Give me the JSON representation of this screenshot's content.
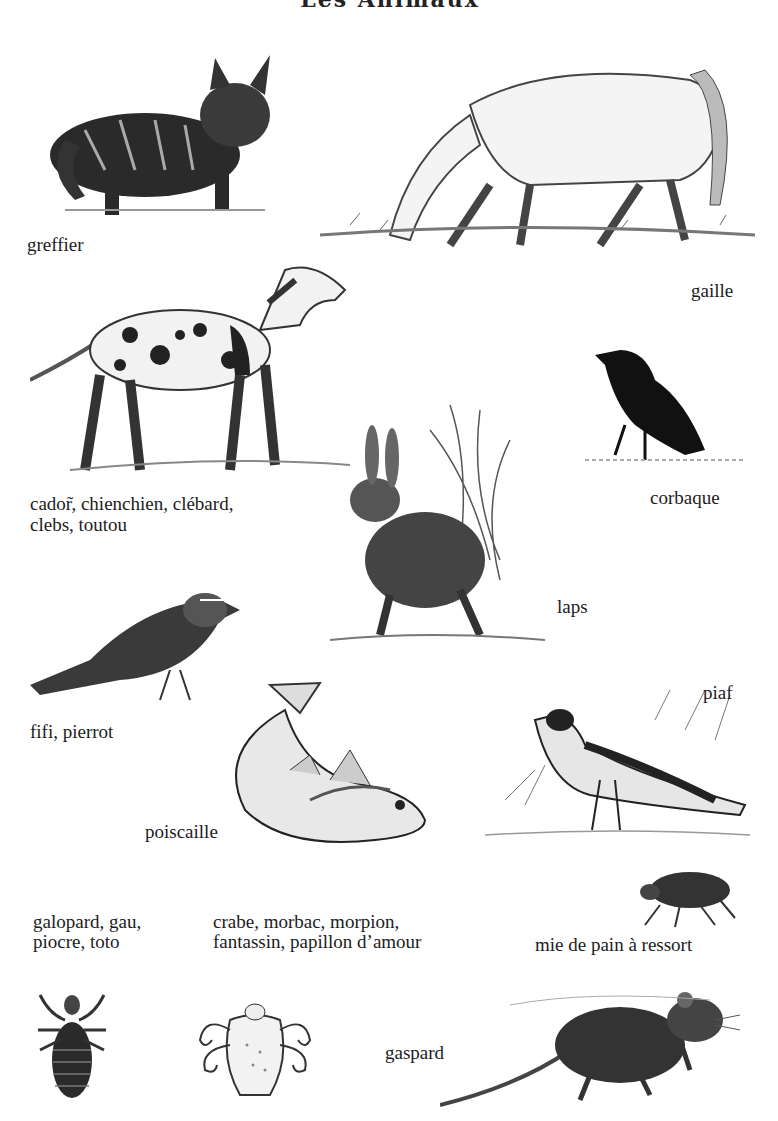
{
  "page": {
    "title": "Les Animaux",
    "background": "#ffffff",
    "ink": "#1c1c1c"
  },
  "entries": [
    {
      "animal": "cat",
      "label": "greffier"
    },
    {
      "animal": "horse",
      "label": "gaille"
    },
    {
      "animal": "dog",
      "label_lines": [
        "cador̃, chienchien, clébard,",
        "clebs, toutou"
      ]
    },
    {
      "animal": "crow",
      "label": "corbaque"
    },
    {
      "animal": "rabbit",
      "label": "laps"
    },
    {
      "animal": "sparrow",
      "label": "fifi, pierrot"
    },
    {
      "animal": "wagtail",
      "label": "piaf"
    },
    {
      "animal": "fish",
      "label": "poiscaille"
    },
    {
      "animal": "head-louse",
      "label_lines": [
        "galopard, gau,",
        "piocre, toto"
      ]
    },
    {
      "animal": "crab-louse",
      "label_lines": [
        "crabe, morbac, morpion,",
        "fantassin, papillon d’amour"
      ]
    },
    {
      "animal": "flea",
      "label": "mie de pain à ressort"
    },
    {
      "animal": "rat",
      "label": "gaspard"
    }
  ]
}
